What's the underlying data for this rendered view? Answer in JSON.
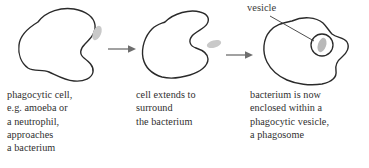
{
  "figure": {
    "background_color": "#ffffff",
    "outline_color": "#2a2a2a",
    "arrow_color": "#6e6e6e",
    "bacterium_color": "#c9c9c9",
    "text_color": "#2f2f2f"
  },
  "annotations": {
    "vesicle_label": "vesicle"
  },
  "stages": [
    {
      "index": 1,
      "name": "phagocytic-cell-approach",
      "caption": "phagocytic cell,\ne.g. amoeba or\na neutrophil,\napproaches\na bacterium",
      "cell_shape": "amoeboid-blob-with-right-notch",
      "bacterium_present": true
    },
    {
      "index": 2,
      "name": "cell-extends-pseudopodia",
      "caption": "cell extends to\nsurround\nthe bacterium",
      "cell_shape": "c-shaped-open-right",
      "bacterium_present": true
    },
    {
      "index": 3,
      "name": "bacterium-enclosed-in-phagosome",
      "caption": "bacterium is now\nenclosed within a\nphagocytic vesicle,\na phagosome",
      "cell_shape": "closed-blob-with-internal-vesicle",
      "bacterium_present": true,
      "vesicle_present": true
    }
  ],
  "arrows": [
    {
      "name": "arrow-stage1-to-stage2",
      "direction": "right"
    },
    {
      "name": "arrow-stage2-to-stage3",
      "direction": "right"
    }
  ]
}
